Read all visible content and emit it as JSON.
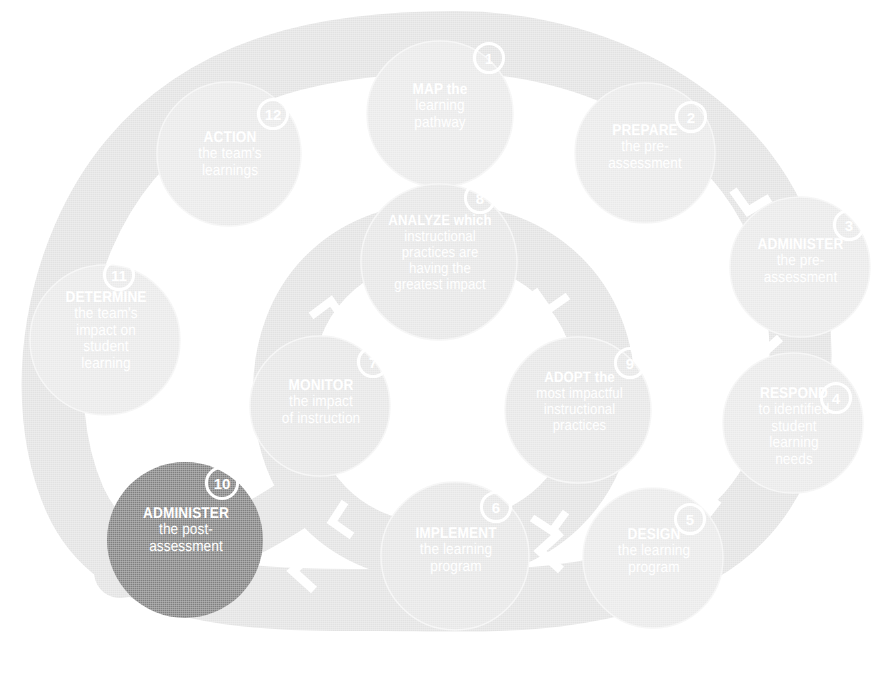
{
  "diagram": {
    "type": "cyclical-process",
    "step_count": 12,
    "colors": {
      "background": "#ffffff",
      "node_fill": "#e8e8e8",
      "node_fill_inner": "#e3e3e3",
      "track_fill": "#e0e0e0",
      "track_fill_light": "#ebebeb",
      "highlight_fill": "#7f7f7f",
      "label_text": "#ffffff",
      "badge_border": "#ffffff"
    },
    "top_crumb": "",
    "outer_loop_steps": [
      1,
      2,
      3,
      4,
      5,
      10,
      11,
      12
    ],
    "inner_loop_steps": [
      6,
      7,
      8,
      9
    ],
    "highlighted_step": 10,
    "steps": [
      {
        "number": "1",
        "lead": "MAP the",
        "rest": "learning\npathway",
        "full": "MAP the learning pathway",
        "highlight": false
      },
      {
        "number": "2",
        "lead": "PREPARE",
        "rest": "the pre-\nassessment",
        "full": "PREPARE the pre-assessment",
        "highlight": false
      },
      {
        "number": "3",
        "lead": "ADMINISTER",
        "rest": "the pre-\nassessment",
        "full": "ADMINISTER the pre-assessment",
        "highlight": false
      },
      {
        "number": "4",
        "lead": "RESPOND",
        "rest": "to identified\nstudent\nlearning\nneeds",
        "full": "RESPOND to identified student learning needs",
        "highlight": false
      },
      {
        "number": "5",
        "lead": "DESIGN",
        "rest": "the learning\nprogram",
        "full": "DESIGN the learning program",
        "highlight": false
      },
      {
        "number": "6",
        "lead": "IMPLEMENT",
        "rest": "the learning\nprogram",
        "full": "IMPLEMENT the learning program",
        "highlight": false
      },
      {
        "number": "7",
        "lead": "MONITOR",
        "rest": "the impact\nof instruction",
        "full": "MONITOR the impact of instruction",
        "highlight": false
      },
      {
        "number": "8",
        "lead": "ANALYZE which",
        "rest": "instructional\npractices are\nhaving the\ngreatest impact",
        "full": "ANALYZE which instructional practices are having the greatest impact",
        "highlight": false
      },
      {
        "number": "9",
        "lead": "ADOPT the",
        "rest": "most impactful\ninstructional\npractices",
        "full": "ADOPT the most impactful instructional practices",
        "highlight": false
      },
      {
        "number": "10",
        "lead": "ADMINISTER",
        "rest": "the post-\nassessment",
        "full": "ADMINISTER the post-assessment",
        "highlight": true
      },
      {
        "number": "11",
        "lead": "DETERMINE",
        "rest": "the team's\nimpact on\nstudent\nlearning",
        "full": "DETERMINE the team's impact on student learning",
        "highlight": false
      },
      {
        "number": "12",
        "lead": "ACTION",
        "rest": "the team's\nlearnings",
        "full": "ACTION the team's learnings",
        "highlight": false
      }
    ]
  }
}
